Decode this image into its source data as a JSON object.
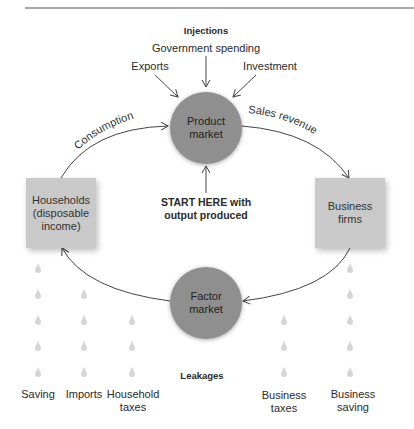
{
  "diagram": {
    "type": "circular-flow",
    "injections": {
      "title": "Injections",
      "items": [
        "Government spending",
        "Exports",
        "Investment"
      ]
    },
    "nodes": {
      "product_market": "Product\nmarket",
      "factor_market": "Factor\nmarket",
      "households": "Households\n(disposable\nincome)",
      "business_firms": "Business\nfirms"
    },
    "flows": {
      "consumption": "Consumption",
      "sales_revenue": "Sales revenue"
    },
    "start_note": "START HERE with\noutput produced",
    "leakages": {
      "title": "Leakages",
      "items": [
        {
          "label": "Saving",
          "drops": 5
        },
        {
          "label": "Imports",
          "drops": 4
        },
        {
          "label": "Household\ntaxes",
          "drops": 3
        },
        {
          "label": "Business\ntaxes",
          "drops": 3
        },
        {
          "label": "Business\nsaving",
          "drops": 5
        }
      ]
    },
    "colors": {
      "circle": "#8f8f8f",
      "box": "#c9c9c9",
      "drop": "#d6d6d6",
      "line": "#444444"
    }
  }
}
